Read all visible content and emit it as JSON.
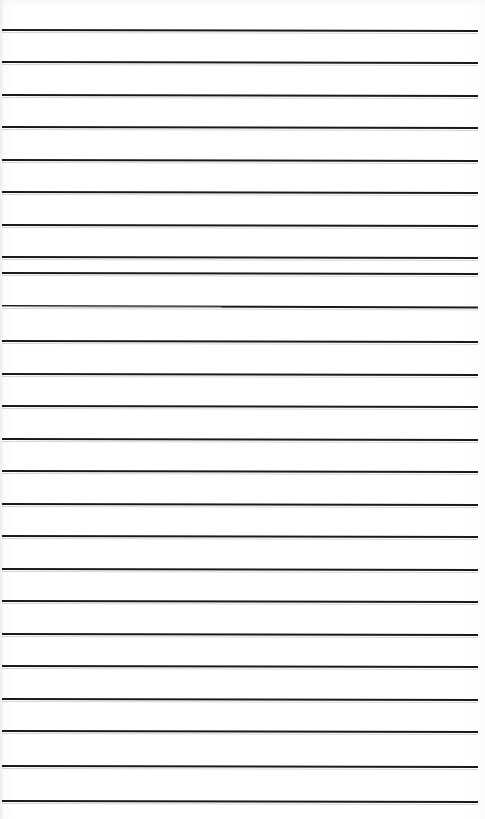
{
  "document": {
    "kind": "scanned-lined-paper",
    "title": "Blank ruled page",
    "page_width": 485,
    "page_height": 819,
    "background_color": "#fdfdfd",
    "rule_color": "#1a1a1c",
    "rule_thickness_px": 2,
    "rule_count": 24,
    "rule_left_x": 2,
    "rule_right_x": 478,
    "first_rule_y": 29,
    "rule_spacing_px": 32.6,
    "handwriting_text": "",
    "margin_rule": "none",
    "body_text": ""
  },
  "rules": [
    {
      "index": 1,
      "y": 29,
      "x_start": 2,
      "x_end": 478,
      "slant_px": 1.0,
      "thickness": 2,
      "faint_left": false
    },
    {
      "index": 2,
      "y": 61,
      "x_start": 2,
      "x_end": 478,
      "slant_px": 1.0,
      "thickness": 2,
      "faint_left": false
    },
    {
      "index": 3,
      "y": 94,
      "x_start": 2,
      "x_end": 478,
      "slant_px": 1.0,
      "thickness": 2,
      "faint_left": false
    },
    {
      "index": 4,
      "y": 126,
      "x_start": 2,
      "x_end": 478,
      "slant_px": 1.0,
      "thickness": 2,
      "faint_left": false
    },
    {
      "index": 5,
      "y": 159,
      "x_start": 2,
      "x_end": 478,
      "slant_px": 1.0,
      "thickness": 2,
      "faint_left": false
    },
    {
      "index": 6,
      "y": 191,
      "x_start": 2,
      "x_end": 478,
      "slant_px": 1.0,
      "thickness": 2,
      "faint_left": false
    },
    {
      "index": 7,
      "y": 224,
      "x_start": 2,
      "x_end": 478,
      "slant_px": 1.0,
      "thickness": 2,
      "faint_left": false
    },
    {
      "index": 8,
      "y": 256,
      "x_start": 2,
      "x_end": 478,
      "slant_px": 1.0,
      "thickness": 2,
      "faint_left": false
    },
    {
      "index": 9,
      "y": 272,
      "x_start": 2,
      "x_end": 478,
      "slant_px": 1.0,
      "thickness": 2,
      "faint_left": false
    },
    {
      "index": 10,
      "y": 305,
      "x_start": 2,
      "x_end": 478,
      "slant_px": 1.5,
      "thickness": 2,
      "faint_left": true
    },
    {
      "index": 11,
      "y": 340,
      "x_start": 2,
      "x_end": 478,
      "slant_px": 1.0,
      "thickness": 2,
      "faint_left": false
    },
    {
      "index": 12,
      "y": 373,
      "x_start": 2,
      "x_end": 478,
      "slant_px": 1.0,
      "thickness": 2,
      "faint_left": false
    },
    {
      "index": 13,
      "y": 405,
      "x_start": 2,
      "x_end": 478,
      "slant_px": 1.0,
      "thickness": 2,
      "faint_left": false
    },
    {
      "index": 14,
      "y": 438,
      "x_start": 2,
      "x_end": 478,
      "slant_px": 1.0,
      "thickness": 2,
      "faint_left": false
    },
    {
      "index": 15,
      "y": 470,
      "x_start": 2,
      "x_end": 478,
      "slant_px": 1.0,
      "thickness": 2,
      "faint_left": false
    },
    {
      "index": 16,
      "y": 503,
      "x_start": 2,
      "x_end": 478,
      "slant_px": 1.0,
      "thickness": 2,
      "faint_left": false
    },
    {
      "index": 17,
      "y": 535,
      "x_start": 2,
      "x_end": 478,
      "slant_px": 1.0,
      "thickness": 2,
      "faint_left": false
    },
    {
      "index": 18,
      "y": 568,
      "x_start": 2,
      "x_end": 478,
      "slant_px": 1.0,
      "thickness": 2,
      "faint_left": false
    },
    {
      "index": 19,
      "y": 600,
      "x_start": 2,
      "x_end": 478,
      "slant_px": 1.0,
      "thickness": 2,
      "faint_left": false
    },
    {
      "index": 20,
      "y": 633,
      "x_start": 2,
      "x_end": 478,
      "slant_px": 1.0,
      "thickness": 2,
      "faint_left": false
    },
    {
      "index": 21,
      "y": 665,
      "x_start": 2,
      "x_end": 478,
      "slant_px": 1.0,
      "thickness": 2,
      "faint_left": false
    },
    {
      "index": 22,
      "y": 698,
      "x_start": 2,
      "x_end": 478,
      "slant_px": 1.0,
      "thickness": 2,
      "faint_left": false
    },
    {
      "index": 23,
      "y": 730,
      "x_start": 2,
      "x_end": 478,
      "slant_px": 1.0,
      "thickness": 2,
      "faint_left": false
    },
    {
      "index": 24,
      "y": 765,
      "x_start": 2,
      "x_end": 478,
      "slant_px": 1.0,
      "thickness": 2,
      "faint_left": false
    },
    {
      "index": 25,
      "y": 800,
      "x_start": 2,
      "x_end": 478,
      "slant_px": 1.0,
      "thickness": 2,
      "faint_left": false
    }
  ]
}
